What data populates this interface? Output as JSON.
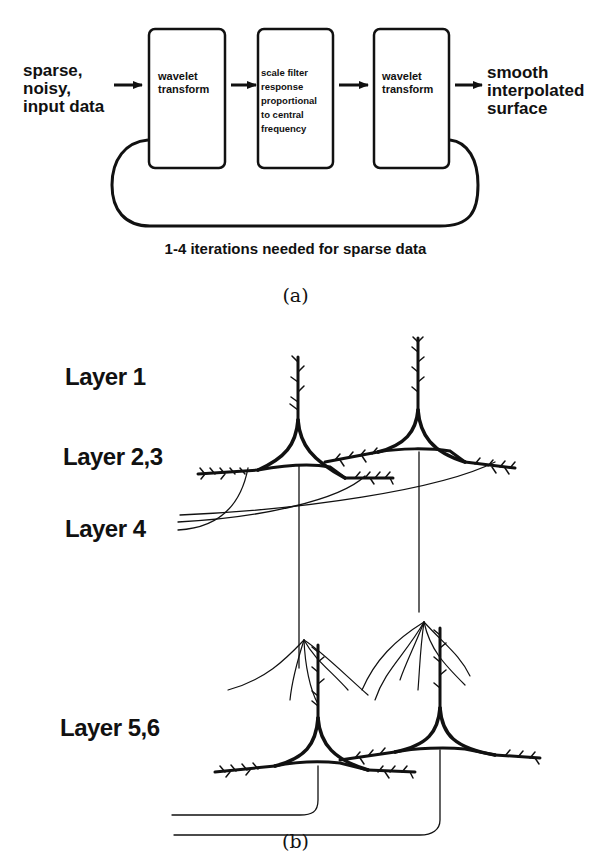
{
  "panel_a": {
    "input_label": [
      "sparse,",
      "noisy,",
      "input data"
    ],
    "boxes": [
      {
        "lines": [
          "wavelet",
          "transform"
        ]
      },
      {
        "lines": [
          "scale filter",
          "response",
          "proportional",
          "to central",
          "frequency"
        ]
      },
      {
        "lines": [
          "wavelet",
          "transform"
        ]
      }
    ],
    "output_label": [
      "smooth",
      "interpolated",
      "surface"
    ],
    "loop_caption": "1-4 iterations needed for sparse data",
    "sublabel": "(a)"
  },
  "panel_b": {
    "layers": [
      {
        "label": "Layer 1"
      },
      {
        "label": "Layer 2,3"
      },
      {
        "label": "Layer 4"
      },
      {
        "label": "Layer 5,6"
      }
    ],
    "sublabel": "(b)"
  }
}
